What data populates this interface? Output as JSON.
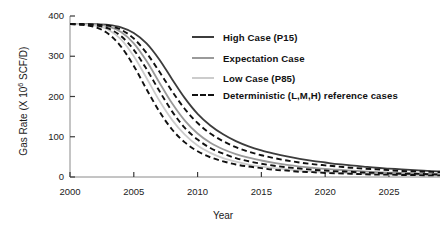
{
  "chart_data": {
    "type": "line",
    "title": "",
    "xlabel": "Year",
    "ylabel": "Gas Rate (X 10⁶ SCF/D)",
    "ylabel_prefix": "Gas Rate (X 10",
    "ylabel_exponent": "6",
    "ylabel_suffix": " SCF/D)",
    "xlim": [
      2000,
      2029
    ],
    "ylim": [
      0,
      400
    ],
    "grid": false,
    "legend_position": "upper-right",
    "xticks": [
      2000,
      2005,
      2010,
      2015,
      2020,
      2025
    ],
    "xtick_labels": [
      "2000",
      "2005",
      "2010",
      "2015",
      "2020",
      "2025"
    ],
    "yticks": [
      0,
      100,
      200,
      300,
      400
    ],
    "ytick_labels": [
      "0",
      "100",
      "200",
      "300",
      "400"
    ],
    "x": [
      2000,
      2001,
      2002,
      2003,
      2004,
      2005,
      2006,
      2007,
      2008,
      2009,
      2010,
      2011,
      2012,
      2013,
      2014,
      2015,
      2016,
      2017,
      2018,
      2019,
      2020,
      2021,
      2022,
      2023,
      2024,
      2025,
      2026,
      2027,
      2028,
      2029
    ],
    "series": [
      {
        "name": "High Case (P15)",
        "style": "solid",
        "color": "#3c3c3c",
        "width": 1.8,
        "values": [
          380,
          380,
          380,
          378,
          372,
          358,
          332,
          292,
          243,
          196,
          157,
          128,
          106,
          89,
          76,
          66,
          58,
          51,
          45,
          40,
          36,
          32,
          29,
          26,
          23,
          21,
          19,
          17,
          15,
          14
        ]
      },
      {
        "name": "Expectation Case",
        "style": "solid",
        "color": "#9a9a9a",
        "width": 1.8,
        "values": [
          380,
          380,
          379,
          374,
          360,
          332,
          288,
          235,
          183,
          140,
          108,
          85,
          69,
          57,
          48,
          41,
          35,
          30,
          26,
          23,
          20,
          18,
          16,
          14,
          12,
          11,
          10,
          9,
          8,
          7
        ]
      },
      {
        "name": "Low Case (P85)",
        "style": "solid",
        "color": "#cccccc",
        "width": 1.8,
        "values": [
          380,
          379,
          376,
          366,
          342,
          300,
          246,
          190,
          142,
          105,
          78,
          60,
          47,
          38,
          31,
          26,
          22,
          19,
          16,
          14,
          12,
          11,
          9,
          8,
          7,
          6,
          6,
          5,
          5,
          4
        ]
      },
      {
        "name": "Deterministic (L,M,H) reference cases",
        "style": "dashed",
        "color": "#111111",
        "width": 1.9,
        "reference_curves": [
          {
            "case": "H",
            "values": [
              380,
              380,
              379,
              376,
              366,
              344,
              308,
              262,
              213,
              169,
              134,
              108,
              89,
              74,
              63,
              54,
              47,
              41,
              36,
              32,
              29,
              26,
              23,
              21,
              19,
              17,
              15,
              14,
              13,
              12
            ]
          },
          {
            "case": "M",
            "values": [
              380,
              379,
              377,
              369,
              350,
              316,
              268,
              214,
              163,
              122,
              93,
              72,
              58,
              47,
              39,
              33,
              28,
              24,
              21,
              18,
              16,
              14,
              13,
              11,
              10,
              9,
              8,
              8,
              7,
              6
            ]
          },
          {
            "case": "L",
            "values": [
              380,
              378,
              372,
              356,
              324,
              276,
              218,
              163,
              118,
              86,
              64,
              49,
              39,
              31,
              26,
              22,
              18,
              16,
              13,
              12,
              10,
              9,
              8,
              7,
              6,
              6,
              5,
              5,
              4,
              4
            ]
          }
        ]
      }
    ],
    "legend_entries": [
      {
        "label": "High Case (P15)",
        "color": "#3c3c3c",
        "style": "solid"
      },
      {
        "label": "Expectation Case",
        "color": "#9a9a9a",
        "style": "solid"
      },
      {
        "label": "Low Case (P85)",
        "color": "#cccccc",
        "style": "solid"
      },
      {
        "label": "Deterministic (L,M,H) reference cases",
        "color": "#111111",
        "style": "dashed"
      }
    ]
  }
}
